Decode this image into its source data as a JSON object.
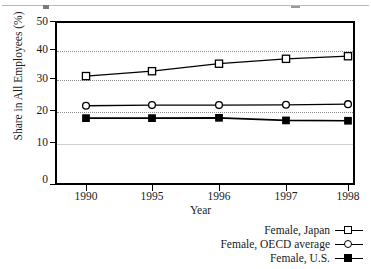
{
  "chart_data": {
    "type": "line",
    "title": "",
    "xlabel": "Year",
    "ylabel": "Share in All Employees (%)",
    "categories": [
      "1990",
      "1995",
      "1996",
      "1997",
      "1998"
    ],
    "x": [
      1990,
      1995,
      1996,
      1997,
      1998
    ],
    "ylim": [
      0,
      50
    ],
    "yticks": [
      0,
      10,
      20,
      30,
      40,
      50
    ],
    "ytick_labels": [
      "0",
      "10",
      "20",
      "30",
      "40",
      "50"
    ],
    "grid": "horizontal-dotted",
    "legend_position": "below-right",
    "series": [
      {
        "name": "Female, Japan",
        "marker": "open-square",
        "color": "#000000",
        "values": [
          33.1,
          34.6,
          36.9,
          38.4,
          39.2
        ]
      },
      {
        "name": "Female, OECD average",
        "marker": "open-circle",
        "color": "#000000",
        "values": [
          24.0,
          24.2,
          24.2,
          24.3,
          24.5
        ]
      },
      {
        "name": "Female, U.S.",
        "marker": "filled-square",
        "color": "#000000",
        "values": [
          20.2,
          20.2,
          20.3,
          19.5,
          19.4
        ]
      }
    ]
  },
  "axes": {
    "y_title": "Share in All Employees (%)",
    "x_title": "Year",
    "y_labels": [
      "50",
      "40",
      "30",
      "20",
      "10",
      "0"
    ],
    "x_labels": [
      "1990",
      "1995",
      "1996",
      "1997",
      "1998"
    ]
  },
  "legend": {
    "entries": [
      {
        "label": "Female, Japan",
        "marker": "open-square"
      },
      {
        "label": "Female, OECD average",
        "marker": "open-circle"
      },
      {
        "label": "Female, U.S.",
        "marker": "filled-square"
      }
    ]
  }
}
